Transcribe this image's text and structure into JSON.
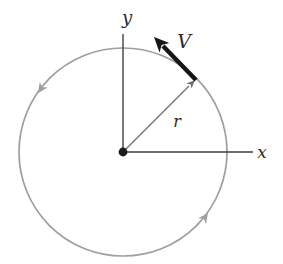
{
  "diagram": {
    "labels": {
      "y_axis": "y",
      "x_axis": "x",
      "radius": "r",
      "velocity": "V"
    },
    "motion_direction": "counterclockwise",
    "colors": {
      "background": "#ffffff",
      "circle": "#9e9e9e",
      "axis": "#3f3f3f",
      "radius_line": "#6f6f6f",
      "velocity_vector": "#161616",
      "center_dot": "#1c1c1c",
      "label": "#2b2b2b"
    }
  }
}
